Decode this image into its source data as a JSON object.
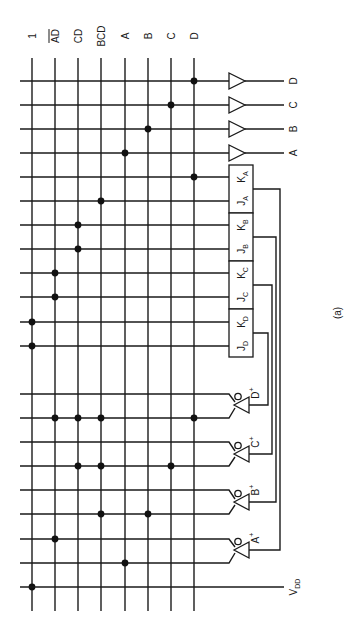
{
  "figure": {
    "caption": "(a)",
    "rotation_deg": -90
  },
  "columns": [
    {
      "id": "one",
      "label": "1",
      "overline": false,
      "x": 32
    },
    {
      "id": "AD",
      "label": "AD",
      "overline": true,
      "x": 55
    },
    {
      "id": "CD",
      "label": "CD",
      "overline": false,
      "x": 78
    },
    {
      "id": "BCD",
      "label": "BCD",
      "overline": false,
      "x": 101
    },
    {
      "id": "A",
      "label": "A",
      "overline": false,
      "x": 125
    },
    {
      "id": "B",
      "label": "B",
      "overline": false,
      "x": 148
    },
    {
      "id": "C",
      "label": "C",
      "overline": false,
      "x": 171
    },
    {
      "id": "D",
      "label": "D",
      "overline": false,
      "x": 194
    }
  ],
  "grid": {
    "x_start": 20,
    "col_top": 58,
    "col_bottom": 611,
    "gate_x": 229
  },
  "output_buffers": [
    {
      "label": "D",
      "y": 81,
      "dots": [
        "D"
      ]
    },
    {
      "label": "C",
      "y": 105,
      "dots": [
        "C"
      ]
    },
    {
      "label": "B",
      "y": 129,
      "dots": [
        "B"
      ]
    },
    {
      "label": "A",
      "y": 153,
      "dots": [
        "A"
      ]
    }
  ],
  "flip_flops": [
    {
      "name": "A",
      "top": 165,
      "bottom": 213,
      "k": {
        "label": "K",
        "sub": "A",
        "y": 177,
        "dots": [
          "D"
        ]
      },
      "j": {
        "label": "J",
        "sub": "A",
        "y": 201,
        "dots": [
          "BCD"
        ]
      },
      "feedback_x": 280
    },
    {
      "name": "B",
      "top": 213,
      "bottom": 261,
      "k": {
        "label": "K",
        "sub": "B",
        "y": 225,
        "dots": [
          "CD"
        ]
      },
      "j": {
        "label": "J",
        "sub": "B",
        "y": 249,
        "dots": [
          "CD"
        ]
      },
      "feedback_x": 276
    },
    {
      "name": "C",
      "top": 261,
      "bottom": 309,
      "k": {
        "label": "K",
        "sub": "C",
        "y": 273,
        "dots": [
          "AD"
        ]
      },
      "j": {
        "label": "J",
        "sub": "C",
        "y": 297,
        "dots": [
          "AD"
        ]
      },
      "feedback_x": 272
    },
    {
      "name": "D",
      "top": 309,
      "bottom": 357,
      "k": {
        "label": "K",
        "sub": "D",
        "y": 322,
        "dots": [
          "one"
        ]
      },
      "j": {
        "label": "J",
        "sub": "D",
        "y": 346,
        "dots": [
          "one"
        ]
      },
      "feedback_x": 268
    }
  ],
  "next_state_gates": [
    {
      "label": "D",
      "sup": "+",
      "in1": {
        "y": 394,
        "dots": []
      },
      "in2": {
        "y": 418,
        "dots": [
          "AD",
          "CD",
          "BCD",
          "D"
        ]
      },
      "out_y": 405,
      "ff": "D"
    },
    {
      "label": "C",
      "sup": "+",
      "in1": {
        "y": 442,
        "dots": []
      },
      "in2": {
        "y": 466,
        "dots": [
          "CD",
          "BCD",
          "C"
        ]
      },
      "out_y": 454,
      "ff": "C"
    },
    {
      "label": "B",
      "sup": "+",
      "in1": {
        "y": 490,
        "dots": []
      },
      "in2": {
        "y": 514,
        "dots": [
          "BCD",
          "B"
        ]
      },
      "out_y": 502,
      "ff": "B"
    },
    {
      "label": "A",
      "sup": "+",
      "in1": {
        "y": 539,
        "dots": [
          "AD"
        ]
      },
      "in2": {
        "y": 563,
        "dots": [
          "A"
        ]
      },
      "out_y": 550,
      "ff": "A"
    }
  ],
  "supply": {
    "label": "V",
    "sub": "DD",
    "y": 587,
    "dots": [
      "one"
    ],
    "x_end": 284
  }
}
